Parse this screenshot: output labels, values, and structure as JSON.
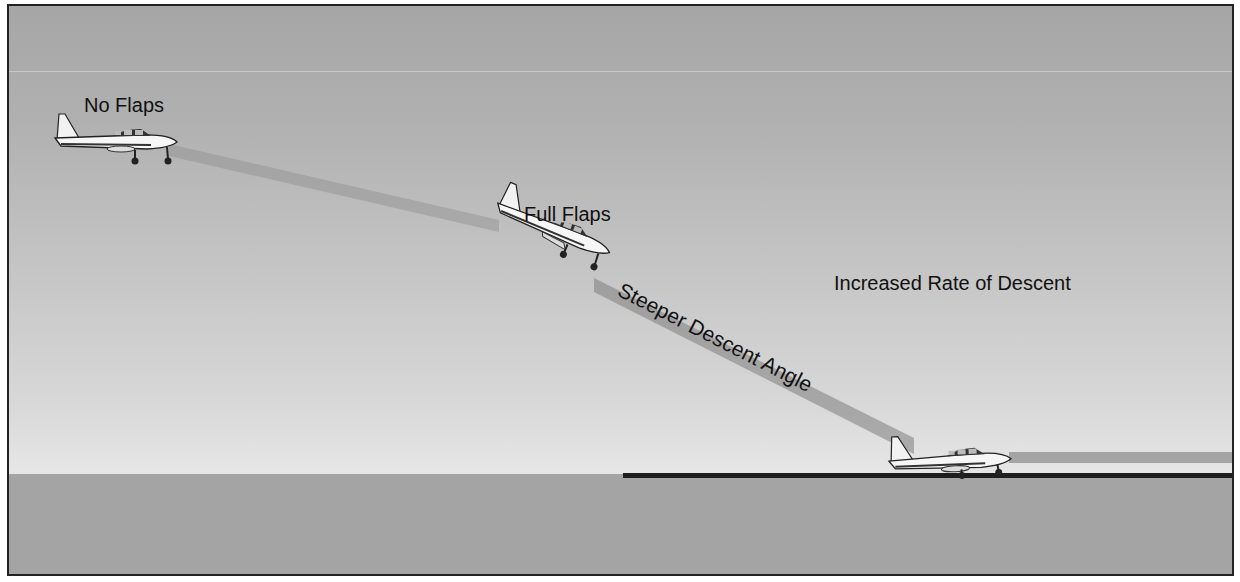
{
  "diagram": {
    "labels": {
      "no_flaps": "No Flaps",
      "full_flaps": "Full Flaps",
      "steeper_angle": "Steeper Descent Angle",
      "increased_rate": "Increased Rate of Descent"
    },
    "colors": {
      "sky_top": "#a6a6a6",
      "sky_bottom": "#e6e6e6",
      "ground": "#a4a4a4",
      "runway": "#1e1e1e",
      "glidepath": "#8c8c8c",
      "text": "#111111"
    },
    "aircraft": [
      {
        "id": "no-flaps",
        "x": 50,
        "y": 108,
        "angle": 0
      },
      {
        "id": "full-flaps",
        "x": 490,
        "y": 200,
        "angle": 22
      },
      {
        "id": "landing",
        "x": 885,
        "y": 435,
        "angle": -3
      }
    ]
  }
}
